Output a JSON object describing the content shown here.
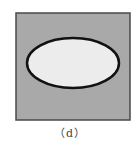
{
  "figure": {
    "caption": "（d）",
    "square": {
      "x": 16,
      "y": 13,
      "width": 114,
      "height": 107,
      "fill": "#a9a9a9",
      "stroke": "#4a4a4a"
    },
    "ellipse": {
      "cx": 73,
      "cy": 63,
      "rx": 46,
      "ry": 25,
      "fill": "#ececec",
      "stroke": "#111111"
    }
  }
}
